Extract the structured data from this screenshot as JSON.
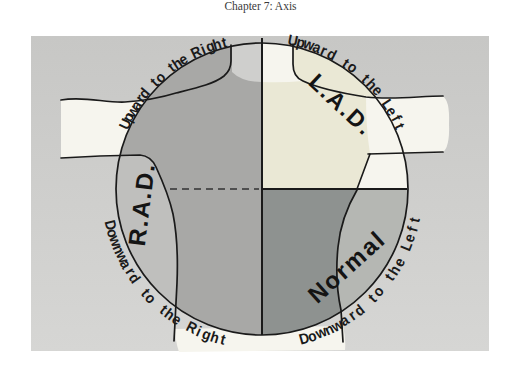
{
  "page": {
    "header": "Chapter 7: Axis"
  },
  "diagram": {
    "arc_labels": {
      "top_left": "Upward to the Right",
      "top_right": "Upward to the Left",
      "bottom_left": "Downward to the Right",
      "bottom_right": "Downward to the Left"
    },
    "quadrant_labels": {
      "upper_right": "L.A.D.",
      "left": "R.A.D.",
      "lower_right": "Normal"
    },
    "colors": {
      "page_background": "#ffffff",
      "header_text": "#3a3a3a",
      "panel_top": "#c7c7c5",
      "panel_bottom": "#d6d6d4",
      "quadrant_gray": "#a8a8a6",
      "quadrant_cream": "#eae8d5",
      "quadrant_slate": "#8e9290",
      "crescent_left": "#bfbfbd",
      "crescent_right": "#b5b7b3",
      "strip_white": "#f6f5ee",
      "top_strip_shaded": "#cfcfcd",
      "line": "#1a1a1a",
      "dash": "#4f4f4f"
    }
  }
}
